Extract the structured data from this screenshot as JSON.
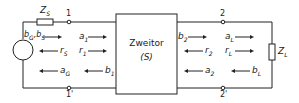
{
  "diagram": {
    "twoport": {
      "label": "Zweitor",
      "sub": "(S)"
    },
    "source": {
      "impedance": "Z",
      "impedance_sub": "S",
      "wave_label": "b",
      "wave_sub1": "G",
      "wave_sub2": "S"
    },
    "load": {
      "impedance": "Z",
      "impedance_sub": "L"
    },
    "terminals": {
      "t1": "1",
      "t1p": "1'",
      "t2": "2",
      "t2p": "2'"
    },
    "left_waves": {
      "r_s": {
        "sym": "r",
        "sub": "S"
      },
      "a_g": {
        "sym": "a",
        "sub": "G"
      },
      "a_1": {
        "sym": "a",
        "sub": "1"
      },
      "r_1": {
        "sym": "r",
        "sub": "1"
      },
      "b_1": {
        "sym": "b",
        "sub": "1"
      }
    },
    "right_waves": {
      "b_2": {
        "sym": "b",
        "sub": "2"
      },
      "r_2": {
        "sym": "r",
        "sub": "2"
      },
      "a_2": {
        "sym": "a",
        "sub": "2"
      },
      "a_l": {
        "sym": "a",
        "sub": "L"
      },
      "r_l": {
        "sym": "r",
        "sub": "L"
      },
      "b_l": {
        "sym": "b",
        "sub": "L"
      }
    }
  }
}
